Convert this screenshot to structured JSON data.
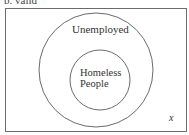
{
  "caption": "b.   valid",
  "diagram": {
    "universe_label": "x",
    "outer_set": {
      "label": "Unemployed"
    },
    "inner_set": {
      "label_line1": "Homeless",
      "label_line2": "People"
    }
  },
  "colors": {
    "stroke": "#6b6b6b",
    "text": "#333333",
    "background": "#ffffff"
  }
}
